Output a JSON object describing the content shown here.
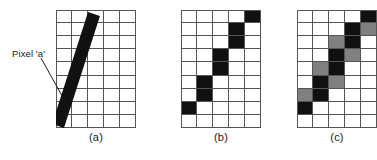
{
  "figure": {
    "grid": {
      "cols": 5,
      "rows": 9
    },
    "colors": {
      "black": "#111111",
      "gray": "#808080",
      "white": "#ffffff",
      "gridline": "#555555",
      "text": "#1a1a1a"
    },
    "annotation": {
      "label": "Pixel 'a'",
      "target_cell": {
        "col": 0,
        "row": 7
      }
    },
    "panels": [
      {
        "id": "a",
        "caption": "(a)",
        "description": "continuous line drawn over the pixel grid",
        "cells": [
          [
            "white",
            "white",
            "white",
            "white",
            "white"
          ],
          [
            "white",
            "white",
            "white",
            "white",
            "white"
          ],
          [
            "white",
            "white",
            "white",
            "white",
            "white"
          ],
          [
            "white",
            "white",
            "white",
            "white",
            "white"
          ],
          [
            "white",
            "white",
            "white",
            "white",
            "white"
          ],
          [
            "white",
            "white",
            "white",
            "white",
            "white"
          ],
          [
            "white",
            "white",
            "white",
            "white",
            "white"
          ],
          [
            "white",
            "white",
            "white",
            "white",
            "white"
          ],
          [
            "white",
            "white",
            "white",
            "white",
            "white"
          ]
        ],
        "line": {
          "x1": 38.0,
          "y1": 4.0,
          "x2": 2.0,
          "y2": 116.0,
          "width": 12.5
        }
      },
      {
        "id": "b",
        "caption": "(b)",
        "description": "binary (aliased) rasterization of the line",
        "cells": [
          [
            "white",
            "white",
            "white",
            "white",
            "black"
          ],
          [
            "white",
            "white",
            "white",
            "black",
            "white"
          ],
          [
            "white",
            "white",
            "white",
            "black",
            "white"
          ],
          [
            "white",
            "white",
            "black",
            "white",
            "white"
          ],
          [
            "white",
            "white",
            "black",
            "white",
            "white"
          ],
          [
            "white",
            "black",
            "white",
            "white",
            "white"
          ],
          [
            "white",
            "black",
            "white",
            "white",
            "white"
          ],
          [
            "black",
            "white",
            "white",
            "white",
            "white"
          ],
          [
            "white",
            "white",
            "white",
            "white",
            "white"
          ]
        ]
      },
      {
        "id": "c",
        "caption": "(c)",
        "description": "anti-aliased rasterization with gray partial-coverage pixels",
        "cells": [
          [
            "white",
            "white",
            "white",
            "white",
            "black"
          ],
          [
            "white",
            "white",
            "white",
            "black",
            "gray"
          ],
          [
            "white",
            "white",
            "gray",
            "black",
            "white"
          ],
          [
            "white",
            "white",
            "black",
            "gray",
            "white"
          ],
          [
            "white",
            "gray",
            "black",
            "white",
            "white"
          ],
          [
            "white",
            "black",
            "gray",
            "white",
            "white"
          ],
          [
            "gray",
            "black",
            "white",
            "white",
            "white"
          ],
          [
            "black",
            "white",
            "white",
            "white",
            "white"
          ],
          [
            "white",
            "white",
            "white",
            "white",
            "white"
          ]
        ]
      }
    ]
  }
}
